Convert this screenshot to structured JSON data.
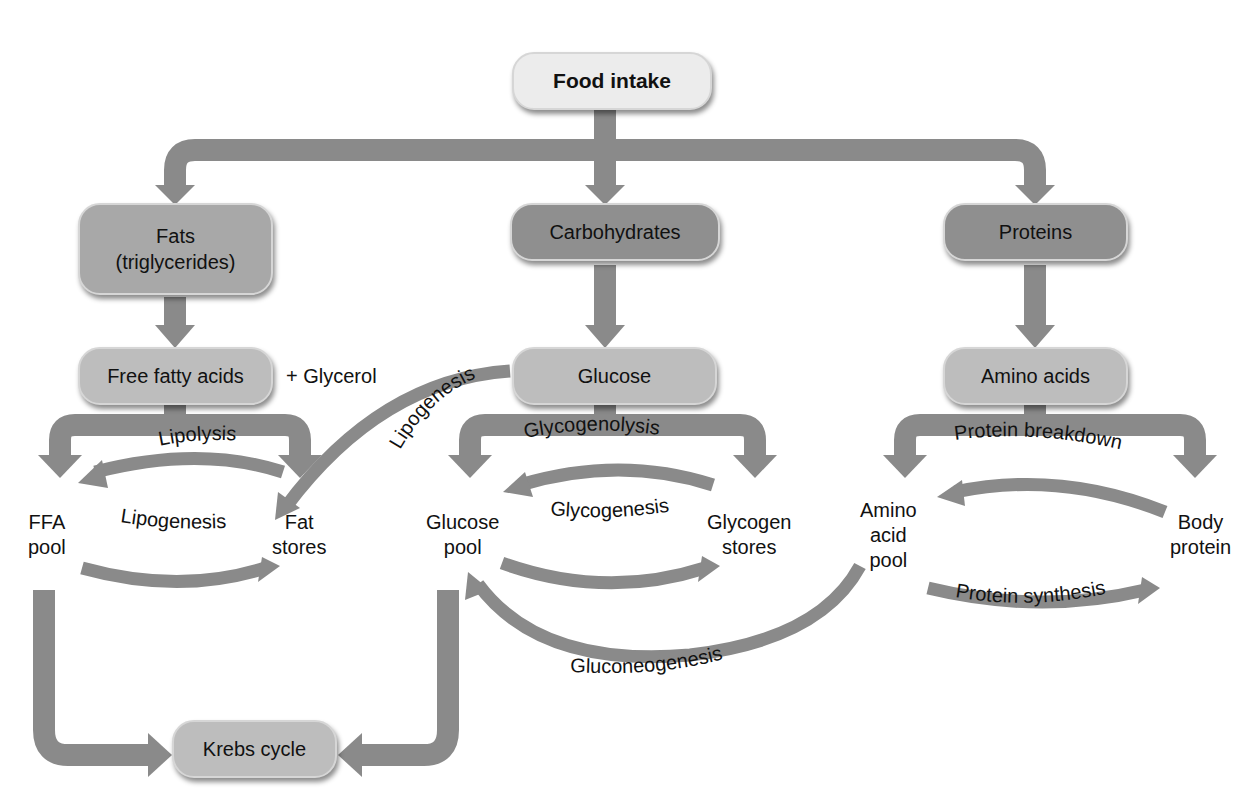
{
  "diagram": {
    "colors": {
      "arrow": "#8a8a8a",
      "top_box": "#ececec",
      "category_box": "#8f8f8f",
      "fats_box": "#a8a8a8",
      "intermediate_box": "#bdbdbd",
      "text": "#111111"
    },
    "nodes": {
      "food_intake": "Food intake",
      "fats_line1": "Fats",
      "fats_line2": "(triglycerides)",
      "carbohydrates": "Carbohydrates",
      "proteins": "Proteins",
      "free_fatty_acids": "Free fatty acids",
      "glycerol": "+ Glycerol",
      "glucose": "Glucose",
      "amino_acids": "Amino acids",
      "ffa_pool_line1": "FFA",
      "ffa_pool_line2": "pool",
      "fat_stores_line1": "Fat",
      "fat_stores_line2": "stores",
      "glucose_pool_line1": "Glucose",
      "glucose_pool_line2": "pool",
      "glycogen_stores_line1": "Glycogen",
      "glycogen_stores_line2": "stores",
      "amino_acid_pool_line1": "Amino",
      "amino_acid_pool_line2": "acid",
      "amino_acid_pool_line3": "pool",
      "body_protein_line1": "Body",
      "body_protein_line2": "protein",
      "krebs_cycle": "Krebs cycle"
    },
    "processes": {
      "lipolysis": "Lipolysis",
      "lipogenesis_fat": "Lipogenesis",
      "lipogenesis_glucose": "Lipogenesis",
      "glycogenolysis": "Glycogenolysis",
      "glycogenesis": "Glycogenesis",
      "gluconeogenesis": "Gluconeogenesis",
      "protein_breakdown": "Protein breakdown",
      "protein_synthesis": "Protein synthesis"
    }
  }
}
